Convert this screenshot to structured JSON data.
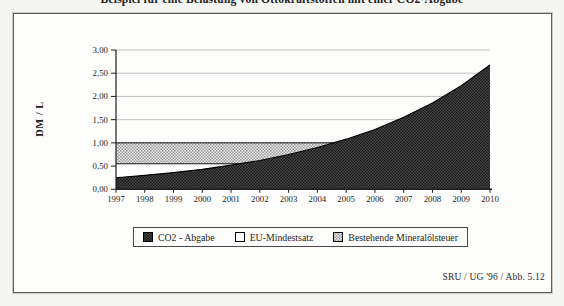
{
  "title": "Beispiel für eine Belastung von Ottokraftstoffen mit einer CO2-Abgabe",
  "source_note": "SRU / UG '96 / Abb. 5.12",
  "colors": {
    "dark_series_base": "#161616",
    "dark_series_check": "#4a4a4a",
    "gray_series_base": "#ececec",
    "gray_series_check": "#9a9a9a",
    "white_series": "#ffffff",
    "gridline": "#b8b8b8",
    "axis": "#1e1e1e",
    "frame_border": "#5f5f5f"
  },
  "chart_data": {
    "type": "area",
    "overlap": true,
    "title": "Beispiel für eine Belastung von Ottokraftstoffen mit einer CO2-Abgabe",
    "xlabel": "",
    "ylabel": "DM / L",
    "ylim": [
      0,
      3.0
    ],
    "ytick_step": 0.5,
    "ytick_labels": [
      "0,00",
      "0,50",
      "1,00",
      "1,50",
      "2,00",
      "2,50",
      "3,00"
    ],
    "grid": true,
    "legend_position": "bottom",
    "categories": [
      "1997",
      "1998",
      "1999",
      "2000",
      "2001",
      "2002",
      "2003",
      "2004",
      "2005",
      "2006",
      "2007",
      "2008",
      "2009",
      "2010"
    ],
    "series": [
      {
        "name": "CO2 - Abgabe",
        "style": "dark-checker",
        "values": [
          0.25,
          0.3,
          0.36,
          0.43,
          0.52,
          0.62,
          0.75,
          0.9,
          1.08,
          1.29,
          1.55,
          1.86,
          2.23,
          2.68
        ]
      },
      {
        "name": "EU-Mindestsatz",
        "style": "white",
        "values": [
          0.55,
          0.55,
          0.55,
          0.55,
          0.55,
          0.55,
          0.55,
          0.55,
          0.55,
          0.55,
          0.55,
          0.55,
          0.55,
          0.55
        ]
      },
      {
        "name": "Bestehende Mineralölsteuer",
        "style": "gray-checker",
        "values": [
          1.0,
          1.0,
          1.0,
          1.0,
          1.0,
          1.0,
          1.0,
          1.0,
          1.0,
          1.0,
          1.0,
          1.0,
          1.0,
          1.0
        ]
      }
    ]
  }
}
